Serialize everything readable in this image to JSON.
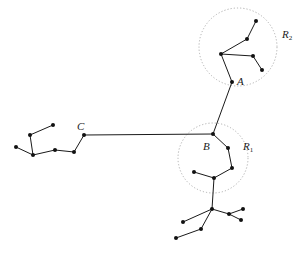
{
  "labels": {
    "A": "A",
    "B": "B",
    "C": "C",
    "R1_main": "R",
    "R1_sub": "1",
    "R2_main": "R",
    "R2_sub": "2"
  },
  "regions": [
    {
      "name": "R2",
      "cx": 238,
      "cy": 47,
      "r": 39
    },
    {
      "name": "R1",
      "cx": 213,
      "cy": 158,
      "r": 35
    }
  ],
  "nodes": [
    {
      "id": "r2_top",
      "x": 256,
      "y": 21
    },
    {
      "id": "r2_mid",
      "x": 247,
      "y": 39
    },
    {
      "id": "r2_junction",
      "x": 221,
      "y": 54
    },
    {
      "id": "r2_right",
      "x": 253,
      "y": 56
    },
    {
      "id": "r2_lowright",
      "x": 262,
      "y": 70
    },
    {
      "id": "A",
      "x": 232,
      "y": 82
    },
    {
      "id": "B",
      "x": 213,
      "y": 134
    },
    {
      "id": "C",
      "x": 84,
      "y": 135
    },
    {
      "id": "l_c2",
      "x": 74,
      "y": 152
    },
    {
      "id": "l_c3",
      "x": 55,
      "y": 150
    },
    {
      "id": "l_junction",
      "x": 33,
      "y": 155
    },
    {
      "id": "l_left",
      "x": 16,
      "y": 147
    },
    {
      "id": "l_up",
      "x": 30,
      "y": 135
    },
    {
      "id": "l_topright",
      "x": 53,
      "y": 125
    },
    {
      "id": "r1_1",
      "x": 228,
      "y": 148
    },
    {
      "id": "r1_2",
      "x": 232,
      "y": 168
    },
    {
      "id": "r1_3",
      "x": 214,
      "y": 178
    },
    {
      "id": "r1_left",
      "x": 194,
      "y": 172
    },
    {
      "id": "b_junction",
      "x": 212,
      "y": 209
    },
    {
      "id": "b_left",
      "x": 183,
      "y": 222
    },
    {
      "id": "b_mid",
      "x": 201,
      "y": 229
    },
    {
      "id": "b_farleft",
      "x": 176,
      "y": 238
    },
    {
      "id": "b_right1",
      "x": 229,
      "y": 214
    },
    {
      "id": "b_right_up",
      "x": 243,
      "y": 209
    },
    {
      "id": "b_right_down",
      "x": 241,
      "y": 220
    }
  ]
}
